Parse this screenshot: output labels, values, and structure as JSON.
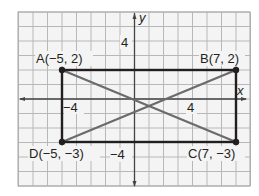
{
  "diagram": {
    "type": "coordinate-plane",
    "axes": {
      "x_label": "x",
      "y_label": "y",
      "x_range": [
        -8,
        8
      ],
      "y_range": [
        -6,
        6
      ],
      "tick_labels": {
        "x_pos": "4",
        "x_neg": "−4",
        "y_pos": "4",
        "y_neg": "−4"
      }
    },
    "points": [
      {
        "name": "A",
        "label": "A(−5, 2)",
        "x": -5,
        "y": 2
      },
      {
        "name": "B",
        "label": "B(7, 2)",
        "x": 7,
        "y": 2
      },
      {
        "name": "C",
        "label": "C(7, −3)",
        "x": 7,
        "y": -3
      },
      {
        "name": "D",
        "label": "D(−5, −3)",
        "x": -5,
        "y": -3
      }
    ],
    "rectangle": [
      "A",
      "B",
      "C",
      "D"
    ],
    "diagonals": [
      [
        "A",
        "C"
      ],
      [
        "B",
        "D"
      ]
    ],
    "colors": {
      "grid": "#b8b8b8",
      "axis": "#444444",
      "rectangle": "#231f20",
      "diagonal": "#6b6b6b",
      "point": "#231f20",
      "background": "#f4f4f4"
    }
  }
}
